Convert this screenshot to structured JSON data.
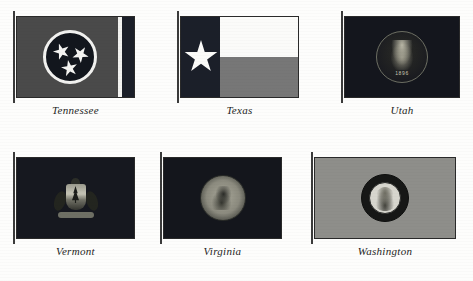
{
  "plate": {
    "layout": "2 rows x 3 columns of state flags with italic captions",
    "background_color": "#fdfdfc",
    "rendering": "grayscale scanned book plate"
  },
  "flags": [
    {
      "id": "tennessee",
      "caption": "Tennessee",
      "icon": "flag-icon",
      "field_color": "#4a4a4a",
      "emblem": "circle-with-three-stars-emblem",
      "emblem_circle_color": "#12161d",
      "emblem_ring_color": "#f2f2f0",
      "stripe_color": "#f2f2f0",
      "bar_color": "#1b1f29",
      "star_count": 3
    },
    {
      "id": "texas",
      "caption": "Texas",
      "icon": "flag-icon",
      "hoist_color": "#1b1f29",
      "upper_band_color": "#fbfbf9",
      "lower_band_color": "#777777",
      "emblem": "lone-star-emblem",
      "star_count": 1
    },
    {
      "id": "utah",
      "caption": "Utah",
      "icon": "flag-icon",
      "field_color": "#14161d",
      "emblem": "state-seal-emblem",
      "seal_date": "1896"
    },
    {
      "id": "vermont",
      "caption": "Vermont",
      "icon": "flag-icon",
      "field_color": "#16181f",
      "emblem": "coat-of-arms-emblem"
    },
    {
      "id": "virginia",
      "caption": "Virginia",
      "icon": "flag-icon",
      "field_color": "#14161c",
      "emblem": "state-seal-emblem"
    },
    {
      "id": "washington",
      "caption": "Washington",
      "icon": "flag-icon",
      "field_color": "#8e8e8a",
      "emblem": "washington-portrait-seal-emblem"
    }
  ]
}
